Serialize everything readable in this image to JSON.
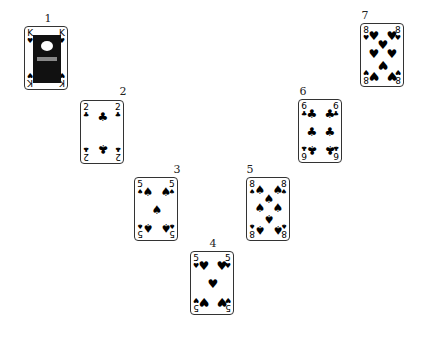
{
  "cards": [
    {
      "position": "1",
      "rank": "K",
      "suit": "hearts",
      "suit_glyph": "♥",
      "x": 24,
      "y": 26,
      "num_x": 38,
      "num_y": 12
    },
    {
      "position": "2",
      "rank": "2",
      "suit": "clubs",
      "suit_glyph": "♣",
      "x": 80,
      "y": 100,
      "num_x": 113,
      "num_y": 85
    },
    {
      "position": "3",
      "rank": "5",
      "suit": "spades",
      "suit_glyph": "♠",
      "x": 134,
      "y": 177,
      "num_x": 167,
      "num_y": 163
    },
    {
      "position": "4",
      "rank": "5",
      "suit": "hearts",
      "suit_glyph": "♥",
      "x": 190,
      "y": 251,
      "num_x": 203,
      "num_y": 237
    },
    {
      "position": "5",
      "rank": "8",
      "suit": "spades",
      "suit_glyph": "♠",
      "x": 246,
      "y": 177,
      "num_x": 240,
      "num_y": 163
    },
    {
      "position": "6",
      "rank": "6",
      "suit": "clubs",
      "suit_glyph": "♣",
      "x": 298,
      "y": 99,
      "num_x": 293,
      "num_y": 85
    },
    {
      "position": "7",
      "rank": "8",
      "suit": "hearts",
      "suit_glyph": "♥",
      "x": 360,
      "y": 23,
      "num_x": 355,
      "num_y": 9
    }
  ]
}
